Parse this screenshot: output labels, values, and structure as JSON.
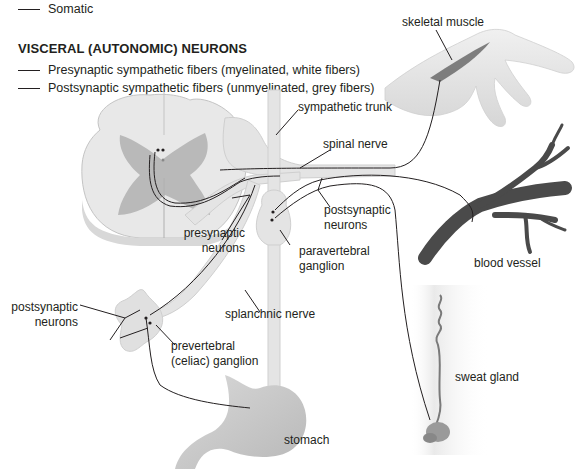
{
  "legend": {
    "somatic": "Somatic",
    "visceral_heading": "VISCERAL (AUTONOMIC) NEURONS",
    "presynaptic": "Presynaptic sympathetic fibers (myelinated, white fibers)",
    "postsynaptic": "Postsynaptic sympathetic fibers (unmyelinated, grey fibers)"
  },
  "labels": {
    "skeletal_muscle": "skeletal muscle",
    "sympathetic_trunk": "sympathetic trunk",
    "spinal_nerve": "spinal nerve",
    "postsynaptic_neurons_upper_1": "postsynaptic",
    "postsynaptic_neurons_upper_2": "neurons",
    "presynaptic_neurons_1": "presynaptic",
    "presynaptic_neurons_2": "neurons",
    "paravertebral_ganglion_1": "paravertebral",
    "paravertebral_ganglion_2": "ganglion",
    "blood_vessel": "blood vessel",
    "splanchnic_nerve": "splanchnic nerve",
    "postsynaptic_neurons_lower_1": "postsynaptic",
    "postsynaptic_neurons_lower_2": "neurons",
    "prevertebral_ganglion_1": "prevertebral",
    "prevertebral_ganglion_2": "(celiac) ganglion",
    "sweat_gland": "sweat gland",
    "stomach": "stomach"
  },
  "colors": {
    "nerve_fill": "#e4e4e4",
    "nerve_stroke": "#c8c8c8",
    "cord_white": "#e8e8e8",
    "cord_grey": "#b9b9b9",
    "vessel": "#4a4a4a",
    "skin": "#e6e6e6",
    "fiber": "#231f20"
  }
}
